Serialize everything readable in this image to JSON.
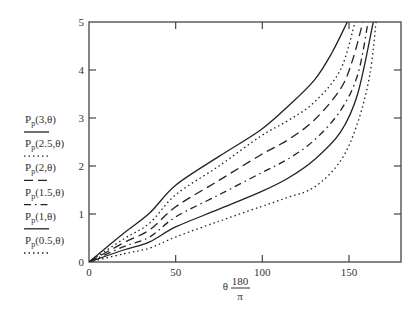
{
  "chart_data": {
    "type": "line",
    "title": "",
    "xlabel": {
      "prefix": "θ",
      "numerator": "180",
      "denominator": "π"
    },
    "ylabel": "",
    "xlim": [
      0,
      180
    ],
    "ylim": [
      0,
      5
    ],
    "xticks": [
      0,
      50,
      100,
      150
    ],
    "xtick_labels": [
      "0",
      "50",
      "100",
      "150"
    ],
    "yticks": [
      0,
      1,
      2,
      3,
      4,
      5
    ],
    "ytick_labels": [
      "0",
      "1",
      "2",
      "3",
      "4",
      "5"
    ],
    "grid": false,
    "legend_position": "left",
    "series": [
      {
        "name": "Pp(3,θ)",
        "label_main": "P",
        "label_sub": "p",
        "label_args": "(3,θ)",
        "style": "solid",
        "x": [
          0,
          20,
          35,
          50,
          75,
          99,
          115,
          130,
          140,
          149
        ],
        "y": [
          0,
          0.6,
          1.02,
          1.6,
          2.2,
          2.75,
          3.25,
          3.79,
          4.35,
          5.0
        ]
      },
      {
        "name": "Pp(2.5,θ)",
        "label_main": "P",
        "label_sub": "p",
        "label_args": "(2.5,θ)",
        "style": "dotted",
        "x": [
          0,
          20,
          35,
          50,
          75,
          99,
          115,
          130,
          145,
          153.5
        ],
        "y": [
          0,
          0.48,
          0.81,
          1.4,
          2.0,
          2.62,
          2.95,
          3.33,
          4.0,
          5.0
        ]
      },
      {
        "name": "Pp(2,θ)",
        "label_main": "P",
        "label_sub": "p",
        "label_args": "(2,θ)",
        "style": "dashed",
        "x": [
          0,
          20,
          35,
          50,
          75,
          99,
          115,
          130,
          145,
          152,
          158
        ],
        "y": [
          0,
          0.4,
          0.67,
          1.15,
          1.7,
          2.23,
          2.55,
          2.96,
          3.6,
          4.2,
          5.0
        ]
      },
      {
        "name": "Pp(1.5,θ)",
        "label_main": "P",
        "label_sub": "p",
        "label_args": "(1.5,θ)",
        "style": "dashdot",
        "x": [
          0,
          20,
          35,
          50,
          75,
          99,
          115,
          130,
          145,
          155,
          161
        ],
        "y": [
          0,
          0.32,
          0.52,
          0.94,
          1.4,
          1.85,
          2.15,
          2.54,
          3.15,
          3.9,
          5.0
        ]
      },
      {
        "name": "Pp(1,θ)",
        "label_main": "P",
        "label_sub": "p",
        "label_args": "(1,θ)",
        "style": "solid",
        "x": [
          0,
          20,
          35,
          50,
          75,
          99,
          115,
          130,
          145,
          155,
          164
        ],
        "y": [
          0,
          0.25,
          0.42,
          0.73,
          1.1,
          1.46,
          1.75,
          2.13,
          2.7,
          3.5,
          5.0
        ]
      },
      {
        "name": "Pp(0.5,θ)",
        "label_main": "P",
        "label_sub": "p",
        "label_args": "(0.5,θ)",
        "style": "dotted",
        "x": [
          0,
          20,
          35,
          50,
          75,
          99,
          115,
          130,
          145,
          155,
          162,
          165.6
        ],
        "y": [
          0,
          0.17,
          0.29,
          0.52,
          0.85,
          1.15,
          1.35,
          1.56,
          2.1,
          2.9,
          3.9,
          5.0
        ]
      }
    ]
  }
}
